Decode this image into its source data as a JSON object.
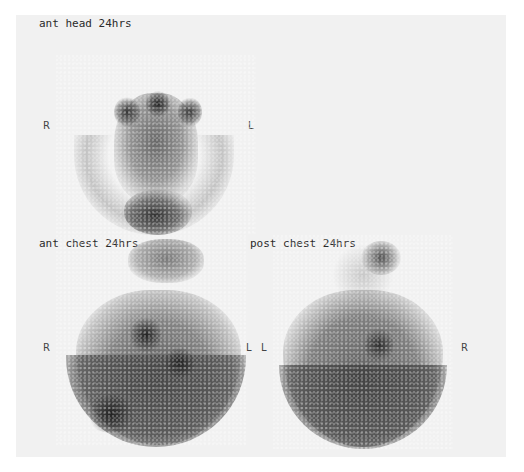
{
  "views": [
    {
      "id": "ant-head",
      "title": "ant head 24hrs",
      "left_marker": "R",
      "right_marker": "L"
    },
    {
      "id": "ant-chest",
      "title": "ant chest 24hrs",
      "left_marker": "R",
      "right_marker": "L"
    },
    {
      "id": "post-chest",
      "title": "post chest 24hrs",
      "left_marker": "L",
      "right_marker": "R"
    }
  ],
  "colors": {
    "background": "#f1f1f1",
    "uptake_dark": "#2b2b2b",
    "uptake_mid": "#6f6f6f"
  }
}
